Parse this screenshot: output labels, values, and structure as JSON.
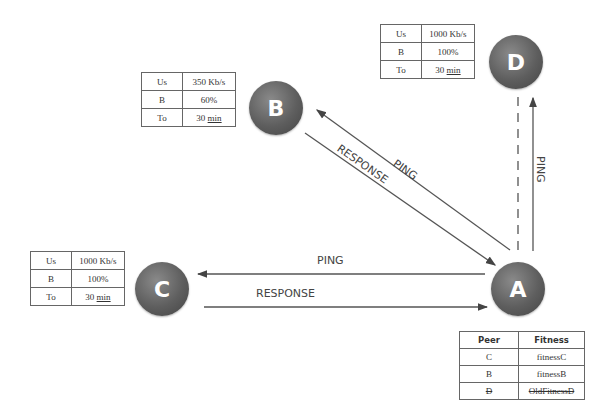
{
  "nodes": {
    "A": {
      "label": "A"
    },
    "B": {
      "label": "B"
    },
    "C": {
      "label": "C"
    },
    "D": {
      "label": "D"
    }
  },
  "tables": {
    "D": {
      "rows": [
        {
          "k": "Us",
          "v": "1000 Kb/s"
        },
        {
          "k": "B",
          "v": "100%"
        },
        {
          "k": "To",
          "v": "30",
          "unit": "min"
        }
      ]
    },
    "B": {
      "rows": [
        {
          "k": "Us",
          "v": "350 Kb/s"
        },
        {
          "k": "B",
          "v": "60%"
        },
        {
          "k": "To",
          "v": "30",
          "unit": "min"
        }
      ]
    },
    "C": {
      "rows": [
        {
          "k": "Us",
          "v": "1000 Kb/s"
        },
        {
          "k": "B",
          "v": "100%"
        },
        {
          "k": "To",
          "v": "30",
          "unit": "min"
        }
      ]
    }
  },
  "fitness_table": {
    "headers": [
      "Peer",
      "Fitness"
    ],
    "rows": [
      {
        "peer": "C",
        "fitness": "fitnessC",
        "struck": false
      },
      {
        "peer": "B",
        "fitness": "fitnessB",
        "struck": false
      },
      {
        "peer": "D",
        "fitness": "OldFitnessD",
        "struck": true
      }
    ]
  },
  "edges": {
    "a_to_b": "PING",
    "b_to_a": "RESPONSE",
    "a_to_d": "PING",
    "a_to_c": "PING",
    "c_to_a": "RESPONSE"
  }
}
